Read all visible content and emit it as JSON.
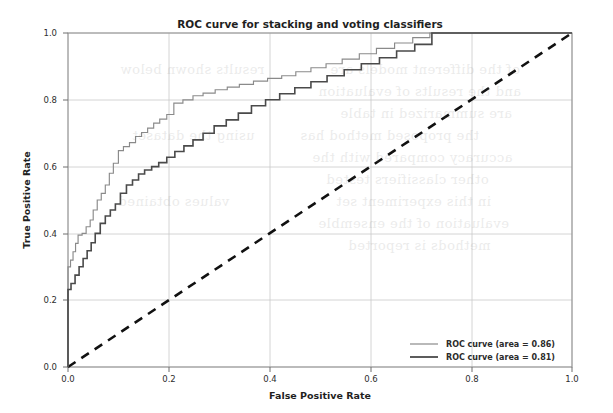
{
  "chart_data": {
    "type": "line",
    "title": "ROC curve for stacking and voting classifiers",
    "xlabel": "False Positive Rate",
    "ylabel": "True Positive Rate",
    "xlim": [
      0.0,
      1.0
    ],
    "ylim": [
      0.0,
      1.0
    ],
    "grid": true,
    "legend_position": "lower right",
    "xticks": [
      "0.0",
      "0.2",
      "0.4",
      "0.6",
      "0.8",
      "1.0"
    ],
    "xtick_values": [
      0.0,
      0.2,
      0.4,
      0.6,
      0.8,
      1.0
    ],
    "yticks": [
      "0.0",
      "0.2",
      "0.4",
      "0.6",
      "0.8",
      "1.0"
    ],
    "ytick_values": [
      0.0,
      0.2,
      0.4,
      0.6,
      0.8,
      1.0
    ],
    "series": [
      {
        "name": "ROC curve (area = 0.86)",
        "area": 0.86,
        "color": "#8a8a8a",
        "style": "solid",
        "x": [
          0.0,
          0.0,
          0.005,
          0.005,
          0.01,
          0.01,
          0.015,
          0.015,
          0.02,
          0.02,
          0.028,
          0.028,
          0.036,
          0.036,
          0.044,
          0.044,
          0.05,
          0.05,
          0.058,
          0.058,
          0.066,
          0.066,
          0.074,
          0.074,
          0.082,
          0.082,
          0.09,
          0.09,
          0.1,
          0.1,
          0.11,
          0.11,
          0.122,
          0.122,
          0.134,
          0.134,
          0.146,
          0.146,
          0.158,
          0.158,
          0.17,
          0.17,
          0.182,
          0.182,
          0.196,
          0.196,
          0.21,
          0.21,
          0.228,
          0.228,
          0.248,
          0.248,
          0.268,
          0.268,
          0.292,
          0.292,
          0.316,
          0.316,
          0.34,
          0.34,
          0.368,
          0.368,
          0.396,
          0.396,
          0.424,
          0.424,
          0.452,
          0.452,
          0.482,
          0.482,
          0.512,
          0.512,
          0.544,
          0.544,
          0.578,
          0.578,
          0.612,
          0.612,
          0.648,
          0.648,
          0.684,
          0.684,
          0.718,
          0.718,
          1.0
        ],
        "y": [
          0.0,
          0.3,
          0.3,
          0.32,
          0.32,
          0.345,
          0.345,
          0.37,
          0.37,
          0.395,
          0.395,
          0.4,
          0.4,
          0.42,
          0.42,
          0.44,
          0.44,
          0.47,
          0.47,
          0.5,
          0.5,
          0.52,
          0.52,
          0.545,
          0.545,
          0.58,
          0.58,
          0.61,
          0.61,
          0.648,
          0.648,
          0.66,
          0.66,
          0.672,
          0.672,
          0.69,
          0.69,
          0.702,
          0.702,
          0.715,
          0.715,
          0.73,
          0.73,
          0.742,
          0.742,
          0.756,
          0.756,
          0.79,
          0.79,
          0.8,
          0.8,
          0.812,
          0.812,
          0.82,
          0.82,
          0.83,
          0.83,
          0.838,
          0.838,
          0.846,
          0.846,
          0.856,
          0.856,
          0.864,
          0.864,
          0.872,
          0.872,
          0.884,
          0.884,
          0.896,
          0.896,
          0.908,
          0.908,
          0.922,
          0.922,
          0.938,
          0.938,
          0.954,
          0.954,
          0.97,
          0.97,
          0.986,
          0.986,
          1.0,
          1.0
        ]
      },
      {
        "name": "ROC curve (area = 0.81)",
        "area": 0.81,
        "color": "#4a4a4a",
        "style": "solid",
        "x": [
          0.0,
          0.0,
          0.006,
          0.006,
          0.014,
          0.014,
          0.022,
          0.022,
          0.03,
          0.03,
          0.038,
          0.038,
          0.046,
          0.046,
          0.054,
          0.054,
          0.064,
          0.064,
          0.074,
          0.074,
          0.084,
          0.084,
          0.094,
          0.094,
          0.104,
          0.104,
          0.116,
          0.116,
          0.128,
          0.128,
          0.14,
          0.14,
          0.152,
          0.152,
          0.166,
          0.166,
          0.18,
          0.18,
          0.196,
          0.196,
          0.212,
          0.212,
          0.23,
          0.23,
          0.248,
          0.248,
          0.268,
          0.268,
          0.29,
          0.29,
          0.314,
          0.314,
          0.338,
          0.338,
          0.364,
          0.364,
          0.392,
          0.392,
          0.42,
          0.42,
          0.45,
          0.45,
          0.482,
          0.482,
          0.514,
          0.514,
          0.548,
          0.548,
          0.582,
          0.582,
          0.618,
          0.618,
          0.652,
          0.652,
          0.688,
          0.688,
          0.722,
          0.722,
          1.0
        ],
        "y": [
          0.0,
          0.232,
          0.232,
          0.25,
          0.25,
          0.275,
          0.275,
          0.3,
          0.3,
          0.325,
          0.325,
          0.348,
          0.348,
          0.372,
          0.372,
          0.4,
          0.4,
          0.43,
          0.43,
          0.452,
          0.452,
          0.47,
          0.47,
          0.488,
          0.488,
          0.52,
          0.52,
          0.545,
          0.545,
          0.56,
          0.56,
          0.578,
          0.578,
          0.59,
          0.59,
          0.6,
          0.6,
          0.612,
          0.612,
          0.628,
          0.628,
          0.645,
          0.645,
          0.662,
          0.662,
          0.68,
          0.68,
          0.7,
          0.7,
          0.722,
          0.722,
          0.74,
          0.74,
          0.76,
          0.76,
          0.782,
          0.782,
          0.8,
          0.8,
          0.818,
          0.818,
          0.836,
          0.836,
          0.854,
          0.854,
          0.872,
          0.872,
          0.89,
          0.89,
          0.908,
          0.908,
          0.926,
          0.926,
          0.946,
          0.946,
          0.966,
          0.966,
          1.0,
          1.0
        ]
      },
      {
        "name": "chance-diagonal",
        "color": "#111111",
        "style": "dashed",
        "x": [
          0.0,
          1.0
        ],
        "y": [
          0.0,
          1.0
        ]
      }
    ]
  },
  "legend": {
    "entries": [
      {
        "label": "ROC curve (area = 0.86)",
        "color": "#8a8a8a"
      },
      {
        "label": "ROC curve (area = 0.81)",
        "color": "#4a4a4a"
      }
    ]
  },
  "style": {
    "grid_color": "#c9c9c9",
    "axis_color": "#8d8d8d",
    "background": "#ffffff"
  }
}
